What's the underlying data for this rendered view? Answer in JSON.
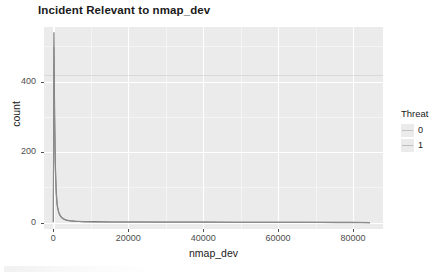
{
  "chart_data": {
    "type": "line",
    "title": "Incident Relevant to nmap_dev",
    "xlabel": "nmap_dev",
    "ylabel": "count",
    "xlim": [
      -2500,
      88000
    ],
    "ylim": [
      -18,
      555
    ],
    "grid": true,
    "legend": {
      "position": "right",
      "title": "Threat",
      "entries": [
        {
          "label": "0",
          "color": "#c2c2c2"
        },
        {
          "label": "1",
          "color": "#bdbdbd"
        }
      ]
    },
    "xticks": [
      {
        "value": 0,
        "label": "0"
      },
      {
        "value": 20000,
        "label": "20000"
      },
      {
        "value": 40000,
        "label": "40000"
      },
      {
        "value": 60000,
        "label": "60000"
      },
      {
        "value": 80000,
        "label": "80000"
      }
    ],
    "yticks": [
      {
        "value": 0,
        "label": "0"
      },
      {
        "value": 200,
        "label": "200"
      },
      {
        "value": 400,
        "label": "400"
      }
    ],
    "xminor": [
      10000,
      30000,
      50000,
      70000
    ],
    "yminor": [
      100,
      300,
      500
    ],
    "series": [
      {
        "name": "0",
        "color": "#6e6e6e",
        "points": [
          [
            0,
            2
          ],
          [
            150,
            540
          ],
          [
            300,
            352
          ],
          [
            500,
            180
          ],
          [
            750,
            92
          ],
          [
            1000,
            52
          ],
          [
            1400,
            30
          ],
          [
            1900,
            18
          ],
          [
            2600,
            11
          ],
          [
            3400,
            7
          ],
          [
            4500,
            5
          ],
          [
            6000,
            4
          ],
          [
            8000,
            3
          ],
          [
            11000,
            3
          ],
          [
            15000,
            2
          ],
          [
            20000,
            2
          ],
          [
            26000,
            2
          ],
          [
            33000,
            2
          ],
          [
            40000,
            2
          ],
          [
            48000,
            1
          ],
          [
            56000,
            1
          ],
          [
            64000,
            1
          ],
          [
            72000,
            1
          ],
          [
            80000,
            1
          ],
          [
            84500,
            0
          ]
        ]
      },
      {
        "name": "1",
        "color": "#8c8c8c",
        "points": [
          [
            0,
            1
          ],
          [
            140,
            498
          ],
          [
            300,
            300
          ],
          [
            520,
            150
          ],
          [
            780,
            78
          ],
          [
            1100,
            42
          ],
          [
            1600,
            24
          ],
          [
            2300,
            14
          ],
          [
            3100,
            9
          ],
          [
            4200,
            6
          ],
          [
            5800,
            4
          ],
          [
            8000,
            3
          ],
          [
            11000,
            2
          ],
          [
            15000,
            2
          ],
          [
            21000,
            2
          ],
          [
            28000,
            1
          ],
          [
            36000,
            1
          ],
          [
            45000,
            1
          ],
          [
            55000,
            1
          ],
          [
            66000,
            1
          ],
          [
            76000,
            0
          ],
          [
            84500,
            0
          ]
        ]
      }
    ],
    "panel_background": "#ebebeb",
    "gridline_color": "#ffffff"
  }
}
